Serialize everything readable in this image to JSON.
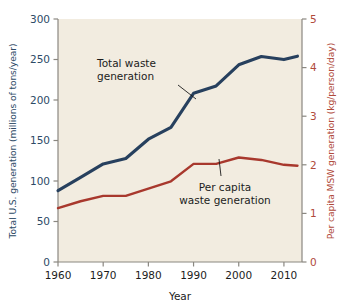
{
  "figure": {
    "background": "#ffffff",
    "plot_background": "#f2ece0"
  },
  "axes": {
    "left": {
      "title": "Total U.S. generation (millions of tons/year)",
      "color": "#2d4a66",
      "ticks": [
        "0",
        "50",
        "100",
        "150",
        "200",
        "250",
        "300"
      ],
      "range_min": 0,
      "range_max": 300
    },
    "right": {
      "title": "Per capita MSW generation (kg/person/day)",
      "color": "#b04a3a",
      "ticks": [
        "0",
        "1",
        "2",
        "3",
        "4",
        "5"
      ],
      "range_min": 0,
      "range_max": 5
    },
    "bottom": {
      "title": "Year",
      "color": "#1c1c1c",
      "ticks": [
        "1960",
        "1970",
        "1980",
        "1990",
        "2000",
        "2010"
      ],
      "range_min": 1960,
      "range_max": 2014
    }
  },
  "annotations": [
    {
      "id": "total-waste",
      "line1": "Total waste",
      "line2": "generation",
      "color": "#1c1c1c"
    },
    {
      "id": "per-capita",
      "line1": "Per capita",
      "line2": "waste generation",
      "color": "#1c1c1c"
    }
  ],
  "chart_data": {
    "type": "line",
    "title": "",
    "subtitle": "",
    "xlabel": "Year",
    "ylabel": "Total U.S. generation (millions of tons/year)",
    "y2label": "Per capita MSW generation (kg/person/day)",
    "xlim": [
      1960,
      2014
    ],
    "ylim": [
      0,
      300
    ],
    "y2lim": [
      0,
      5
    ],
    "xticks": [
      1960,
      1970,
      1980,
      1990,
      2000,
      2010
    ],
    "yticks": [
      0,
      50,
      100,
      150,
      200,
      250,
      300
    ],
    "y2ticks": [
      0,
      1,
      2,
      3,
      4,
      5
    ],
    "grid": false,
    "legend": "annotated-inline",
    "series": [
      {
        "name": "Total waste generation",
        "axis": "left",
        "color": "#27405e",
        "units": "millions of tons/year",
        "x": [
          1960,
          1965,
          1970,
          1975,
          1980,
          1985,
          1990,
          1995,
          2000,
          2005,
          2010,
          2013
        ],
        "values": [
          88.1,
          104.4,
          121.1,
          127.8,
          151.6,
          166.3,
          208.3,
          217.3,
          243.5,
          253.7,
          249.9,
          254.1
        ]
      },
      {
        "name": "Per capita waste generation",
        "axis": "right",
        "color": "#a8382d",
        "units": "kg/person/day",
        "x": [
          1960,
          1965,
          1970,
          1975,
          1980,
          1985,
          1990,
          1995,
          2000,
          2005,
          2010,
          2013
        ],
        "values": [
          1.11,
          1.25,
          1.36,
          1.36,
          1.51,
          1.66,
          2.02,
          2.02,
          2.15,
          2.1,
          2.0,
          1.98
        ]
      }
    ]
  }
}
